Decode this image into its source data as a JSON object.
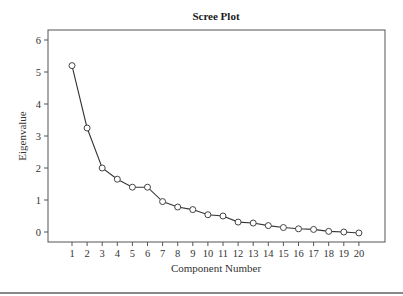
{
  "chart_data": {
    "type": "line",
    "title": "Scree Plot",
    "xlabel": "Component Number",
    "ylabel": "Eigenvalue",
    "x": [
      1,
      2,
      3,
      4,
      5,
      6,
      7,
      8,
      9,
      10,
      11,
      12,
      13,
      14,
      15,
      16,
      17,
      18,
      19,
      20
    ],
    "series": [
      {
        "name": "Eigenvalue",
        "values": [
          5.2,
          3.25,
          2.0,
          1.65,
          1.4,
          1.4,
          0.95,
          0.78,
          0.7,
          0.54,
          0.5,
          0.31,
          0.28,
          0.2,
          0.14,
          0.1,
          0.08,
          0.02,
          0.0,
          -0.03
        ],
        "marker": "open-circle"
      }
    ],
    "xticks": [
      "1",
      "2",
      "3",
      "4",
      "5",
      "6",
      "7",
      "8",
      "9",
      "10",
      "11",
      "12",
      "13",
      "14",
      "15",
      "16",
      "17",
      "18",
      "19",
      "20"
    ],
    "yticks": [
      "0",
      "1",
      "2",
      "3",
      "4",
      "5",
      "6"
    ],
    "ylim": [
      -0.3,
      6.4
    ],
    "xlim": [
      -0.6,
      21.2
    ],
    "grid": false,
    "legend": null
  },
  "layout": {
    "plot": {
      "left": 48,
      "top": 30,
      "right": 385,
      "bottom": 242
    },
    "x0": 72,
    "xstep": 15.1,
    "y0": 232,
    "ystep": 32,
    "line_color": "#333333",
    "marker_fill": "#ffffff"
  }
}
